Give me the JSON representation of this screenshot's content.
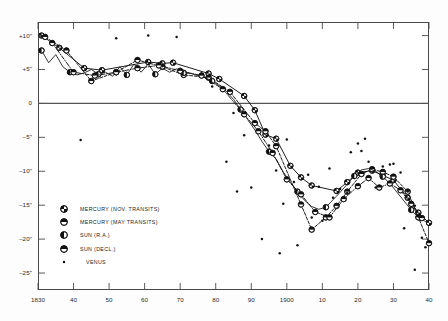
{
  "figure": {
    "background_color": "#ffffff",
    "frame_color": "#4a4a4a",
    "zero_line_color": "#555555"
  },
  "chart_data": {
    "type": "line",
    "title": "",
    "subtitle": "",
    "xlabel": "",
    "ylabel": "",
    "xlim": [
      1830,
      1940
    ],
    "ylim": [
      -27.5,
      12.0
    ],
    "grid": false,
    "legend_position": "lower-left-inside",
    "x_ticks": [
      1830,
      1840,
      1850,
      1860,
      1870,
      1880,
      1890,
      1900,
      1910,
      1920,
      1930,
      1940
    ],
    "x_tick_labels": [
      "1830",
      "40",
      "50",
      "60",
      "70",
      "80",
      "90",
      "1900",
      "10",
      "20",
      "30",
      "40"
    ],
    "y_ticks": [
      10,
      5,
      0,
      -5,
      -10,
      -15,
      -20,
      -25
    ],
    "y_tick_labels": [
      "+10\"",
      "+5\"",
      "0",
      "–5\"",
      "–10\"",
      "–15\"",
      "–20\"",
      "–25\""
    ],
    "zero_line": 0,
    "series": [
      {
        "name": "MERCURY (NOV. TRANSITS)",
        "marker": "circle-quartered",
        "line_style": "solid",
        "points": [
          [
            1831,
            10.0
          ],
          [
            1836,
            8.2
          ],
          [
            1843,
            5.2
          ],
          [
            1848,
            4.9
          ],
          [
            1861,
            6.1
          ],
          [
            1865,
            5.9
          ],
          [
            1868,
            6.0
          ],
          [
            1878,
            4.4
          ],
          [
            1881,
            3.6
          ],
          [
            1888,
            1.1
          ],
          [
            1891,
            -1.0
          ],
          [
            1894,
            -4.6
          ],
          [
            1897,
            -5.2
          ],
          [
            1901,
            -9.2
          ],
          [
            1904,
            -10.9
          ],
          [
            1907,
            -12.1
          ],
          [
            1914,
            -12.9
          ],
          [
            1917,
            -11.6
          ],
          [
            1920,
            -10.2
          ],
          [
            1924,
            -9.9
          ],
          [
            1927,
            -10.6
          ],
          [
            1930,
            -11.3
          ],
          [
            1934,
            -13.9
          ],
          [
            1937,
            -16.1
          ],
          [
            1940,
            -17.6
          ]
        ]
      },
      {
        "name": "MERCURY (MAY TRANSITS)",
        "marker": "circle-halved-horizontal",
        "line_style": "dashed",
        "points": [
          [
            1832,
            9.8
          ],
          [
            1838,
            7.8
          ],
          [
            1845,
            3.3
          ],
          [
            1852,
            4.6
          ],
          [
            1858,
            6.4
          ],
          [
            1865,
            5.4
          ],
          [
            1871,
            4.2
          ],
          [
            1878,
            3.8
          ],
          [
            1884,
            1.7
          ],
          [
            1891,
            -2.9
          ],
          [
            1894,
            -4.1
          ],
          [
            1897,
            -6.3
          ],
          [
            1904,
            -14.9
          ],
          [
            1907,
            -18.6
          ],
          [
            1911,
            -16.8
          ],
          [
            1914,
            -15.1
          ],
          [
            1917,
            -13.0
          ],
          [
            1921,
            -10.4
          ],
          [
            1924,
            -9.7
          ],
          [
            1927,
            -10.1
          ],
          [
            1930,
            -10.8
          ],
          [
            1934,
            -13.0
          ],
          [
            1937,
            -16.8
          ],
          [
            1940,
            -20.6
          ]
        ]
      },
      {
        "name": "SUN (R.A.)",
        "marker": "circle-left-filled",
        "line_style": "solid-jagged",
        "points": [
          [
            1831,
            7.8
          ],
          [
            1833,
            6.0
          ],
          [
            1835,
            7.2
          ],
          [
            1837,
            5.4
          ],
          [
            1839,
            4.6
          ],
          [
            1841,
            4.2
          ],
          [
            1843,
            4.5
          ],
          [
            1845,
            5.0
          ],
          [
            1847,
            4.3
          ],
          [
            1849,
            4.6
          ],
          [
            1851,
            4.0
          ],
          [
            1853,
            5.4
          ],
          [
            1855,
            4.2
          ],
          [
            1857,
            5.8
          ],
          [
            1859,
            4.6
          ],
          [
            1861,
            5.8
          ],
          [
            1863,
            4.3
          ],
          [
            1865,
            5.2
          ],
          [
            1867,
            4.6
          ],
          [
            1869,
            5.1
          ],
          [
            1871,
            4.5
          ],
          [
            1873,
            4.4
          ],
          [
            1875,
            4.1
          ],
          [
            1877,
            3.8
          ],
          [
            1879,
            3.3
          ],
          [
            1881,
            2.6
          ],
          [
            1883,
            1.8
          ],
          [
            1885,
            0.6
          ],
          [
            1887,
            -0.9
          ],
          [
            1889,
            -2.4
          ],
          [
            1891,
            -3.9
          ],
          [
            1893,
            -5.6
          ],
          [
            1895,
            -7.1
          ],
          [
            1897,
            -8.2
          ],
          [
            1899,
            -10.1
          ],
          [
            1901,
            -11.6
          ],
          [
            1903,
            -13.0
          ],
          [
            1905,
            -14.3
          ],
          [
            1907,
            -15.2
          ],
          [
            1909,
            -15.6
          ],
          [
            1911,
            -15.3
          ],
          [
            1913,
            -14.2
          ],
          [
            1915,
            -13.1
          ],
          [
            1917,
            -11.9
          ],
          [
            1919,
            -10.7
          ],
          [
            1921,
            -9.8
          ],
          [
            1923,
            -9.6
          ],
          [
            1925,
            -10.0
          ],
          [
            1927,
            -10.8
          ],
          [
            1929,
            -11.8
          ],
          [
            1931,
            -13.1
          ],
          [
            1933,
            -14.4
          ],
          [
            1935,
            -15.7
          ],
          [
            1937,
            -16.8
          ],
          [
            1939,
            -17.4
          ]
        ]
      },
      {
        "name": "SUN (DECL.)",
        "marker": "circle-halved-horizontal",
        "line_style": "dash-dot",
        "points": [
          [
            1834,
            8.9
          ],
          [
            1840,
            4.6
          ],
          [
            1846,
            4.1
          ],
          [
            1852,
            4.6
          ],
          [
            1858,
            5.2
          ],
          [
            1864,
            5.6
          ],
          [
            1870,
            4.8
          ],
          [
            1876,
            4.1
          ],
          [
            1882,
            2.1
          ],
          [
            1888,
            -1.6
          ],
          [
            1892,
            -4.1
          ],
          [
            1896,
            -7.3
          ],
          [
            1900,
            -11.2
          ],
          [
            1904,
            -13.4
          ],
          [
            1908,
            -16.0
          ],
          [
            1912,
            -16.8
          ],
          [
            1916,
            -14.1
          ],
          [
            1920,
            -12.2
          ],
          [
            1923,
            -11.0
          ],
          [
            1926,
            -12.4
          ],
          [
            1929,
            -11.8
          ],
          [
            1932,
            -12.8
          ],
          [
            1935,
            -14.8
          ],
          [
            1938,
            -16.9
          ]
        ]
      },
      {
        "name": "VENUS",
        "marker": "dot-small",
        "line_style": "none",
        "points": [
          [
            1831,
            9.9
          ],
          [
            1852,
            9.6
          ],
          [
            1861,
            10.0
          ],
          [
            1869,
            9.8
          ],
          [
            1842,
            -5.4
          ],
          [
            1876,
            4.4
          ],
          [
            1879,
            2.5
          ],
          [
            1885,
            -1.4
          ],
          [
            1888,
            -4.7
          ],
          [
            1895,
            -6.2
          ],
          [
            1900,
            -5.3
          ],
          [
            1897,
            -9.9
          ],
          [
            1902,
            -11.6
          ],
          [
            1906,
            -10.5
          ],
          [
            1899,
            -14.8
          ],
          [
            1907,
            -16.8
          ],
          [
            1910,
            -17.3
          ],
          [
            1893,
            -20.0
          ],
          [
            1903,
            -20.9
          ],
          [
            1898,
            -22.1
          ],
          [
            1912,
            -9.6
          ],
          [
            1915,
            -12.6
          ],
          [
            1918,
            -7.2
          ],
          [
            1921,
            -7.0
          ],
          [
            1917,
            -13.2
          ],
          [
            1923,
            -8.6
          ],
          [
            1927,
            -9.3
          ],
          [
            1925,
            -12.4
          ],
          [
            1930,
            -8.9
          ],
          [
            1932,
            -10.2
          ],
          [
            1929,
            -9.0
          ],
          [
            1934,
            -13.0
          ],
          [
            1936,
            -15.1
          ],
          [
            1933,
            -18.4
          ],
          [
            1938,
            -19.8
          ],
          [
            1936,
            -24.5
          ],
          [
            1939,
            -21.2
          ],
          [
            1920,
            -5.9
          ],
          [
            1922,
            -5.2
          ],
          [
            1909,
            -12.3
          ],
          [
            1913,
            -13.9
          ],
          [
            1890,
            -12.4
          ],
          [
            1886,
            -13.0
          ],
          [
            1883,
            -8.6
          ]
        ]
      }
    ]
  },
  "legend": {
    "entries": [
      {
        "label": "MERCURY (NOV. TRANSITS)",
        "marker": "circle-quartered"
      },
      {
        "label": "MERCURY (MAY TRANSITS)",
        "marker": "circle-halved-horizontal"
      },
      {
        "label": "SUN (R.A.)",
        "marker": "circle-left-filled"
      },
      {
        "label": "SUN (DECL.)",
        "marker": "circle-halved-horizontal"
      },
      {
        "label": "VENUS",
        "marker": "dot-small"
      }
    ]
  }
}
